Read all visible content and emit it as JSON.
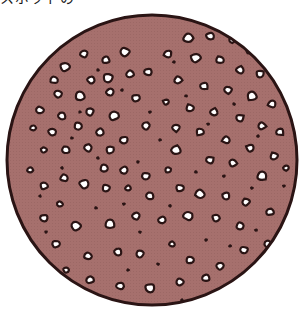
{
  "caption": {
    "text": "スポットの",
    "visible": "bottom edge only (cropped)"
  },
  "illustration": {
    "subject": "circular-textured-disc",
    "description": "Mauve disc with white holes outlined in black and small dark specks",
    "colors": {
      "fill": "#a6706d",
      "outline": "#2a1414",
      "hole": "#ffffff",
      "background": "#ffffff"
    },
    "circle": {
      "cx": 152,
      "cy": 160,
      "r": 145,
      "stroke_width": 3
    },
    "holes": [
      [
        125,
        52,
        5
      ],
      [
        106,
        60,
        4
      ],
      [
        84,
        54,
        4
      ],
      [
        65,
        67,
        5
      ],
      [
        54,
        80,
        4
      ],
      [
        91,
        80,
        4
      ],
      [
        108,
        78,
        5
      ],
      [
        130,
        74,
        4
      ],
      [
        148,
        72,
        4
      ],
      [
        58,
        94,
        4
      ],
      [
        80,
        96,
        5
      ],
      [
        110,
        92,
        4
      ],
      [
        136,
        98,
        4
      ],
      [
        40,
        110,
        4
      ],
      [
        62,
        116,
        4
      ],
      [
        90,
        112,
        4
      ],
      [
        114,
        116,
        5
      ],
      [
        33,
        128,
        3
      ],
      [
        52,
        132,
        4
      ],
      [
        78,
        126,
        4
      ],
      [
        100,
        132,
        4
      ],
      [
        124,
        140,
        4
      ],
      [
        44,
        150,
        3
      ],
      [
        66,
        150,
        4
      ],
      [
        88,
        148,
        4
      ],
      [
        110,
        150,
        4
      ],
      [
        188,
        38,
        5
      ],
      [
        210,
        36,
        4
      ],
      [
        232,
        40,
        3
      ],
      [
        250,
        50,
        4
      ],
      [
        168,
        54,
        4
      ],
      [
        196,
        58,
        5
      ],
      [
        220,
        60,
        4
      ],
      [
        240,
        70,
        4
      ],
      [
        260,
        74,
        4
      ],
      [
        178,
        80,
        4
      ],
      [
        204,
        86,
        4
      ],
      [
        228,
        90,
        4
      ],
      [
        252,
        96,
        5
      ],
      [
        272,
        104,
        4
      ],
      [
        166,
        102,
        3
      ],
      [
        190,
        108,
        4
      ],
      [
        214,
        112,
        4
      ],
      [
        240,
        118,
        4
      ],
      [
        262,
        126,
        4
      ],
      [
        280,
        132,
        4
      ],
      [
        176,
        128,
        4
      ],
      [
        200,
        132,
        4
      ],
      [
        226,
        140,
        4
      ],
      [
        250,
        148,
        4
      ],
      [
        274,
        156,
        4
      ],
      [
        176,
        150,
        5
      ],
      [
        210,
        160,
        4
      ],
      [
        233,
        163,
        4
      ],
      [
        262,
        176,
        5
      ],
      [
        286,
        168,
        3
      ],
      [
        180,
        188,
        4
      ],
      [
        200,
        194,
        5
      ],
      [
        226,
        196,
        4
      ],
      [
        246,
        202,
        4
      ],
      [
        270,
        212,
        4
      ],
      [
        188,
        216,
        5
      ],
      [
        216,
        218,
        4
      ],
      [
        240,
        226,
        4
      ],
      [
        162,
        220,
        4
      ],
      [
        244,
        250,
        4
      ],
      [
        268,
        244,
        4
      ],
      [
        270,
        262,
        3
      ],
      [
        220,
        266,
        4
      ],
      [
        190,
        260,
        4
      ],
      [
        172,
        244,
        3
      ],
      [
        150,
        288,
        5
      ],
      [
        180,
        282,
        4
      ],
      [
        206,
        278,
        4
      ],
      [
        232,
        286,
        3
      ],
      [
        44,
        186,
        4
      ],
      [
        64,
        178,
        4
      ],
      [
        84,
        184,
        5
      ],
      [
        106,
        188,
        4
      ],
      [
        128,
        188,
        3
      ],
      [
        44,
        218,
        4
      ],
      [
        76,
        226,
        5
      ],
      [
        110,
        224,
        5
      ],
      [
        136,
        216,
        4
      ],
      [
        56,
        244,
        4
      ],
      [
        88,
        256,
        4
      ],
      [
        118,
        252,
        4
      ],
      [
        140,
        254,
        4
      ],
      [
        90,
        280,
        4
      ],
      [
        120,
        286,
        4
      ],
      [
        66,
        270,
        3
      ],
      [
        104,
        168,
        4
      ],
      [
        124,
        170,
        4
      ],
      [
        146,
        176,
        4
      ],
      [
        60,
        204,
        3
      ],
      [
        150,
        196,
        4
      ],
      [
        146,
        126,
        4
      ],
      [
        168,
        170,
        3
      ],
      [
        30,
        170,
        3
      ]
    ],
    "specks": [
      [
        98,
        70,
        2
      ],
      [
        122,
        90,
        2
      ],
      [
        150,
        112,
        2
      ],
      [
        72,
        138,
        2
      ],
      [
        98,
        158,
        2
      ],
      [
        138,
        162,
        2
      ],
      [
        160,
        140,
        2
      ],
      [
        186,
        96,
        2
      ],
      [
        208,
        124,
        2
      ],
      [
        234,
        104,
        2
      ],
      [
        258,
        136,
        2
      ],
      [
        224,
        176,
        2
      ],
      [
        252,
        188,
        2
      ],
      [
        196,
        172,
        2
      ],
      [
        170,
        206,
        2
      ],
      [
        206,
        240,
        2
      ],
      [
        230,
        246,
        2
      ],
      [
        256,
        230,
        2
      ],
      [
        158,
        264,
        2
      ],
      [
        182,
        300,
        2
      ],
      [
        200,
        300,
        2
      ],
      [
        124,
        204,
        2
      ],
      [
        96,
        208,
        2
      ],
      [
        62,
        168,
        2
      ],
      [
        46,
        232,
        2
      ],
      [
        128,
        270,
        2
      ],
      [
        104,
        300,
        2
      ],
      [
        140,
        232,
        2
      ],
      [
        80,
        112,
        2
      ],
      [
        174,
        62,
        2
      ],
      [
        284,
        186,
        2
      ],
      [
        286,
        224,
        2
      ],
      [
        40,
        196,
        2
      ]
    ]
  }
}
